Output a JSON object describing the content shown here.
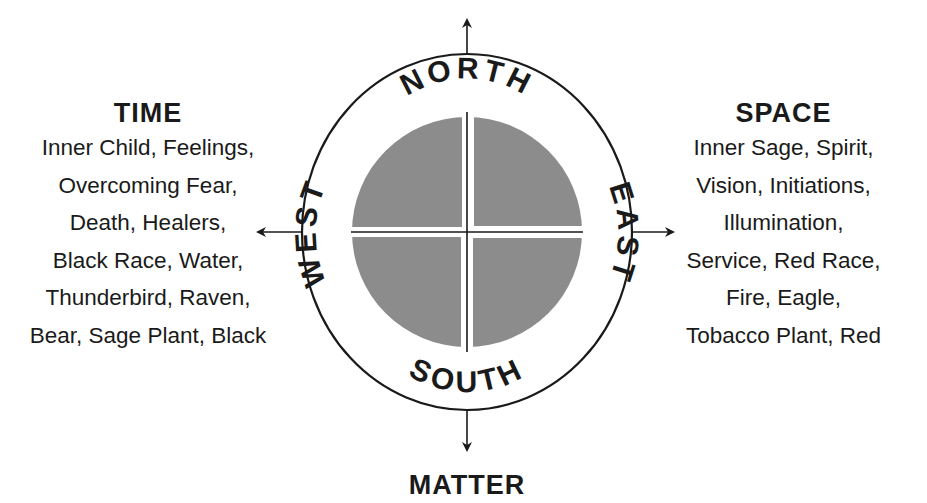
{
  "diagram": {
    "directions": {
      "north": "NORTH",
      "south": "SOUTH",
      "east": "EAST",
      "west": "WEST"
    },
    "time": {
      "title": "TIME",
      "lines": [
        "Inner Child, Feelings,",
        "Overcoming Fear,",
        "Death, Healers,",
        "Black Race, Water,",
        "Thunderbird, Raven,",
        "Bear, Sage Plant, Black"
      ]
    },
    "space": {
      "title": "SPACE",
      "lines": [
        "Inner Sage, Spirit,",
        "Vision, Initiations,",
        "Illumination,",
        "Service, Red Race,",
        "Fire, Eagle,",
        "Tobacco Plant, Red"
      ]
    },
    "matter": {
      "title": "MATTER"
    },
    "colors": {
      "quadrant_fill": "#8c8c8c",
      "stroke": "#1a1a1a",
      "background": "#ffffff"
    }
  }
}
